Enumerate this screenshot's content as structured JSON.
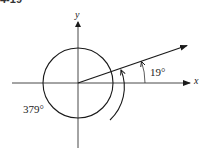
{
  "figure": {
    "cropped_header_text": "4-19",
    "axes": {
      "x_label": "x",
      "y_label": "y"
    },
    "angles": {
      "reference_angle_label": "19°",
      "total_angle_label": "379°"
    },
    "geometry": {
      "origin": [
        78,
        83
      ],
      "circle_radius": 35,
      "terminal_angle_deg": 19,
      "total_rotation_deg": 379
    },
    "colors": {
      "stroke": "#1a1a1a",
      "background": "#ffffff"
    }
  }
}
